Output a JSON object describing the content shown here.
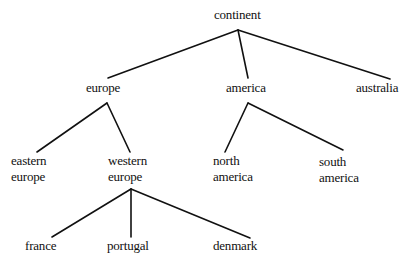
{
  "diagram": {
    "type": "tree",
    "line_color": "#111111",
    "background": "#ffffff",
    "nodes": {
      "continent": {
        "lines": [
          "continent"
        ]
      },
      "europe": {
        "lines": [
          "europe"
        ]
      },
      "america": {
        "lines": [
          "america"
        ]
      },
      "australia": {
        "lines": [
          "australia"
        ]
      },
      "eastern_europe": {
        "lines": [
          "eastern",
          "europe"
        ]
      },
      "western_europe": {
        "lines": [
          "western",
          "europe"
        ]
      },
      "north_america": {
        "lines": [
          "north",
          "america"
        ]
      },
      "south_america": {
        "lines": [
          "south",
          "america"
        ]
      },
      "france": {
        "lines": [
          "france"
        ]
      },
      "portugal": {
        "lines": [
          "portugal"
        ]
      },
      "denmark": {
        "lines": [
          "denmark"
        ]
      }
    },
    "edges": [
      {
        "from": "continent",
        "to": "europe"
      },
      {
        "from": "continent",
        "to": "america"
      },
      {
        "from": "continent",
        "to": "australia"
      },
      {
        "from": "europe",
        "to": "eastern_europe"
      },
      {
        "from": "europe",
        "to": "western_europe"
      },
      {
        "from": "america",
        "to": "north_america"
      },
      {
        "from": "america",
        "to": "south_america"
      },
      {
        "from": "western_europe",
        "to": "france"
      },
      {
        "from": "western_europe",
        "to": "portugal"
      },
      {
        "from": "western_europe",
        "to": "denmark"
      }
    ]
  }
}
